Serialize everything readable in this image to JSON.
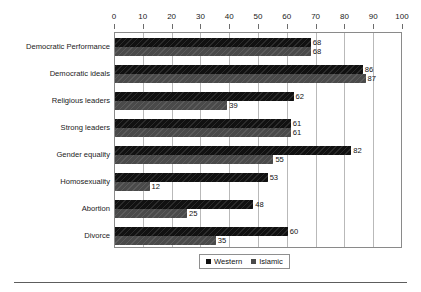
{
  "chart_data": {
    "type": "bar",
    "orientation": "horizontal",
    "title": "",
    "xlabel": "",
    "ylabel": "",
    "xlim": [
      0,
      100
    ],
    "xticks": [
      0,
      10,
      20,
      30,
      40,
      50,
      60,
      70,
      80,
      90,
      100
    ],
    "grid": true,
    "axis_position": "top",
    "legend_position": "bottom",
    "categories": [
      "Democratic Performance",
      "Democratic ideals",
      "Religious leaders",
      "Strong leaders",
      "Gender equality",
      "Homosexuality",
      "Abortion",
      "Divorce"
    ],
    "series": [
      {
        "name": "Western",
        "color": "#111111",
        "values": [
          68,
          86,
          62,
          61,
          82,
          53,
          48,
          60
        ]
      },
      {
        "name": "Islamic",
        "color": "#4a4a4a",
        "values": [
          68,
          87,
          39,
          61,
          55,
          12,
          25,
          35
        ]
      }
    ]
  },
  "legend": {
    "items": [
      {
        "label": "Western"
      },
      {
        "label": "Islamic"
      }
    ]
  }
}
